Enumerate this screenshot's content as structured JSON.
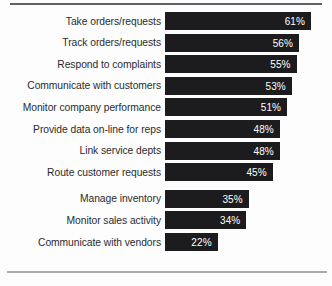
{
  "chart_data": {
    "type": "bar",
    "orientation": "horizontal",
    "title": "",
    "subtitle": "",
    "xlabel": "",
    "ylabel": "",
    "xlim": [
      0,
      61
    ],
    "grid": false,
    "legend": null,
    "value_suffix": "%",
    "bar_color": "#1c1c1e",
    "value_label_color": "#ffffff",
    "category_label_color": "#2a2b2d",
    "background_color": "#fdfdfd",
    "top_rule_color": "#5f6164",
    "bottom_rule_color": "#a7a9ab",
    "categories": [
      "Take orders/requests",
      "Track orders/requests",
      "Respond to complaints",
      "Communicate with customers",
      "Monitor company performance",
      "Provide data on-line for reps",
      "Link service depts",
      "Route customer requests",
      "Manage inventory",
      "Monitor sales activity",
      "Communicate with vendors"
    ],
    "values": [
      61,
      56,
      55,
      53,
      51,
      48,
      48,
      45,
      35,
      34,
      22
    ],
    "value_labels": [
      "61%",
      "56%",
      "55%",
      "53%",
      "51%",
      "48%",
      "48%",
      "45%",
      "35%",
      "34%",
      "22%"
    ],
    "group_break_after_index": 7
  }
}
